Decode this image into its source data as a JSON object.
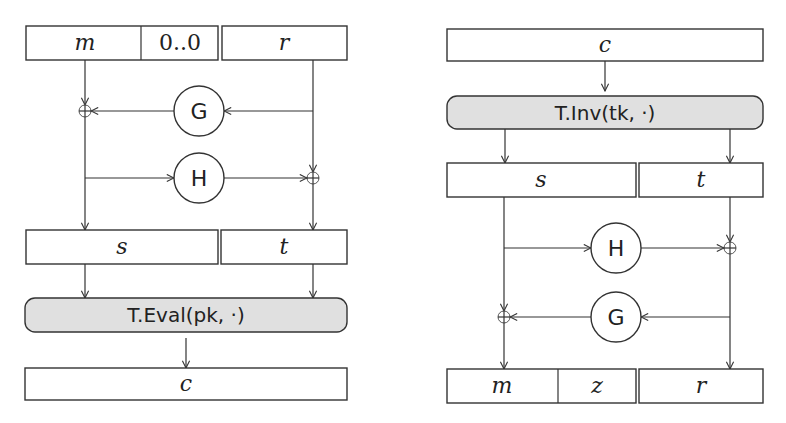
{
  "left_diagram": {
    "name": "encryption",
    "top_row": {
      "m": "m",
      "pad": "0..0",
      "r": "r"
    },
    "G": "G",
    "H": "H",
    "mid_row": {
      "s": "s",
      "t": "t"
    },
    "op": "T.Eval(pk, ·)",
    "output": "c"
  },
  "right_diagram": {
    "name": "decryption",
    "input": "c",
    "op": "T.Inv(tk, ·)",
    "mid_row": {
      "s": "s",
      "t": "t"
    },
    "H": "H",
    "G": "G",
    "bottom_row": {
      "m": "m",
      "z": "z",
      "r": "r"
    }
  },
  "colors": {
    "stroke": "#333333",
    "op_fill": "#e0e0e0",
    "background": "#ffffff"
  }
}
